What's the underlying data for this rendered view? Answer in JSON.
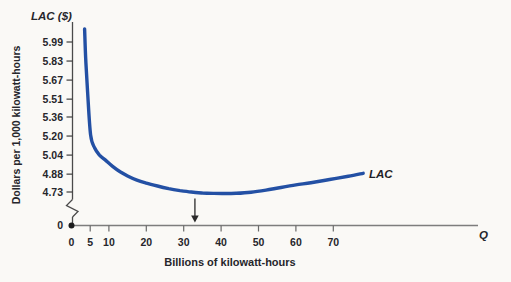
{
  "title": "LAC ($)",
  "y_axis": {
    "label": "Dollars per 1,000 kilowatt-hours",
    "ticks": [
      "5.99",
      "5.83",
      "5.67",
      "5.51",
      "5.36",
      "5.20",
      "5.04",
      "4.88",
      "4.73"
    ],
    "origin": "0",
    "has_break": true
  },
  "x_axis": {
    "label": "Billions of kilowatt-hours",
    "symbol": "Q",
    "ticks": [
      "0",
      "5",
      "10",
      "20",
      "30",
      "40",
      "50",
      "60",
      "70"
    ]
  },
  "curve": {
    "label": "LAC"
  },
  "chart_data": {
    "type": "line",
    "title": "LAC ($)",
    "xlabel": "Billions of kilowatt-hours",
    "ylabel": "Dollars per 1,000 kilowatt-hours",
    "x_ticks": [
      0,
      5,
      10,
      20,
      30,
      40,
      50,
      60,
      70
    ],
    "y_ticks": [
      5.99,
      5.83,
      5.67,
      5.51,
      5.36,
      5.2,
      5.04,
      4.88,
      4.73
    ],
    "ylim_shown": [
      4.73,
      5.99
    ],
    "axis_break_y": true,
    "grid": false,
    "legend": "none",
    "series": [
      {
        "name": "LAC",
        "points": [
          [
            3.5,
            6.1
          ],
          [
            3.8,
            5.85
          ],
          [
            4.3,
            5.57
          ],
          [
            5.1,
            5.21
          ],
          [
            6.2,
            5.1
          ],
          [
            7.5,
            5.04
          ],
          [
            9,
            5.0
          ],
          [
            11,
            4.945
          ],
          [
            13,
            4.9
          ],
          [
            15,
            4.865
          ],
          [
            17.5,
            4.83
          ],
          [
            20,
            4.805
          ],
          [
            23,
            4.78
          ],
          [
            26,
            4.758
          ],
          [
            29,
            4.742
          ],
          [
            32,
            4.73
          ],
          [
            35,
            4.722
          ],
          [
            38,
            4.718
          ],
          [
            41,
            4.717
          ],
          [
            44,
            4.719
          ],
          [
            48,
            4.728
          ],
          [
            52,
            4.746
          ],
          [
            56,
            4.768
          ],
          [
            60,
            4.79
          ],
          [
            64,
            4.808
          ],
          [
            69,
            4.835
          ],
          [
            74,
            4.862
          ],
          [
            78,
            4.887
          ]
        ]
      }
    ],
    "annotations": [
      {
        "type": "arrow-down",
        "x": 33
      }
    ],
    "colors": {
      "curve": "#2350a4",
      "text": "#26262b",
      "axis": "#6e6e6e"
    }
  }
}
